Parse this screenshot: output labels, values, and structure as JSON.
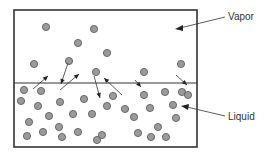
{
  "labels": {
    "vapor": "Vapor",
    "liquid": "Liquid"
  },
  "colors": {
    "particle_fill": "#9a9a9a",
    "particle_stroke": "#555555",
    "line": "#333333"
  },
  "vapor_particles": [
    [
      46,
      27
    ],
    [
      94,
      29
    ],
    [
      78,
      43
    ],
    [
      107,
      53
    ],
    [
      34,
      64
    ],
    [
      69,
      61
    ],
    [
      96,
      72
    ],
    [
      144,
      72
    ],
    [
      181,
      64
    ]
  ],
  "liquid_particles": [
    [
      24,
      90
    ],
    [
      41,
      91
    ],
    [
      21,
      101
    ],
    [
      38,
      106
    ],
    [
      60,
      102
    ],
    [
      84,
      99
    ],
    [
      113,
      96
    ],
    [
      144,
      95
    ],
    [
      165,
      92
    ],
    [
      182,
      92
    ],
    [
      29,
      122
    ],
    [
      49,
      116
    ],
    [
      73,
      114
    ],
    [
      92,
      114
    ],
    [
      107,
      106
    ],
    [
      125,
      109
    ],
    [
      134,
      117
    ],
    [
      150,
      108
    ],
    [
      173,
      105
    ],
    [
      188,
      95
    ],
    [
      27,
      136
    ],
    [
      43,
      132
    ],
    [
      59,
      127
    ],
    [
      78,
      132
    ],
    [
      102,
      135
    ],
    [
      138,
      133
    ],
    [
      158,
      127
    ],
    [
      176,
      118
    ],
    [
      62,
      137
    ],
    [
      97,
      140
    ],
    [
      151,
      137
    ],
    [
      166,
      137
    ]
  ],
  "arrows": [
    [
      33,
      89,
      48,
      76
    ],
    [
      68,
      63,
      61,
      84
    ],
    [
      60,
      90,
      79,
      74
    ],
    [
      94,
      76,
      100,
      98
    ],
    [
      122,
      95,
      104,
      78
    ],
    [
      135,
      80,
      141,
      87
    ],
    [
      176,
      75,
      187,
      85
    ]
  ]
}
